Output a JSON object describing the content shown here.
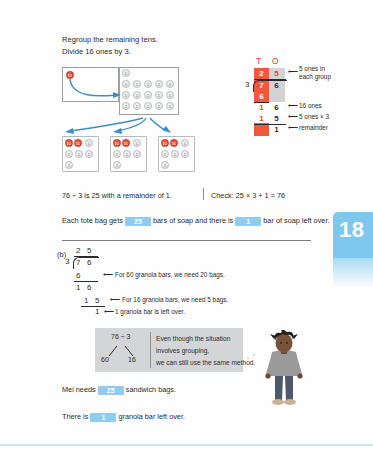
{
  "page": {
    "tab_number": "18"
  },
  "heading": {
    "line1": "Regroup the remaining tens.",
    "line2": "Divide 16 ones by 3."
  },
  "place_value_diagram": {
    "left_box": {
      "tens_discs": 1,
      "disc_label": "10"
    },
    "right_box": {
      "top_row_ones": 1,
      "rows": 3,
      "per_row": 5,
      "total_ones": 16,
      "disc_label": "1"
    },
    "groups": [
      {
        "tens": 2,
        "ones": 5
      },
      {
        "tens": 2,
        "ones": 5
      },
      {
        "tens": 2,
        "ones": 5
      }
    ]
  },
  "long_division_a": {
    "header_t": "T",
    "header_o": "O",
    "divisor": "3",
    "quotient_tens": "2",
    "quotient_ones": "5",
    "dividend_tens": "7",
    "dividend_ones": "6",
    "sub1_tens": "6",
    "rem1_tens": "1",
    "rem1_ones": "6",
    "sub2_tens": "1",
    "sub2_ones": "5",
    "remainder": "1",
    "annotations": {
      "quotient_note_line1": "5 ones in",
      "quotient_note_line2": "each group",
      "sixteen_ones": "16 ones",
      "five_times_three": "5 ones × 3",
      "remainder_label": "remainder"
    },
    "arrow_glyph": "⟵"
  },
  "summary": {
    "statement": "76 ÷ 3 is 25 with a remainder of 1.",
    "check": "Check: 25 × 3 + 1 = 76"
  },
  "fill_in_soap": {
    "prefix": "Each tote bag gets",
    "answer1": "25",
    "middle": "bars of soap and there is",
    "answer2": "1",
    "suffix": "bar of soap left over."
  },
  "part_b": {
    "label": "(b)",
    "divisor": "3",
    "quotient_tens": "2",
    "quotient_ones": "5",
    "dividend_tens": "7",
    "dividend_ones": "6",
    "sub1": "6",
    "rem1_tens": "1",
    "rem1_ones": "6",
    "sub2_tens": "1",
    "sub2_ones": "5",
    "remainder": "1",
    "annotations": {
      "note1": "For 60 granola bars, we need 20 bags.",
      "note2": "For 16 granola bars, we need 5 bags.",
      "note3": "1 granola bar is left over."
    },
    "arrow_glyph": "⟵"
  },
  "info_panel": {
    "expression": "76 ÷ 3",
    "branch_left": "60",
    "branch_right": "16",
    "text_line1": "Even though the situation",
    "text_line2": "involves grouping,",
    "text_line3": "we can still use the same method."
  },
  "fill_in_bags": {
    "prefix": "Mei needs",
    "answer": "25",
    "suffix": "sandwich bags."
  },
  "fill_in_leftover": {
    "prefix": "There is",
    "answer": "1",
    "suffix": "granola bar left over."
  },
  "colors": {
    "tens_red": "#f0573c",
    "ones_grey": "#d2d3d4",
    "chip_blue": "#8fcdf0",
    "tab_blue": "#7ec7ee",
    "arrow_blue": "#3b8fc4"
  }
}
